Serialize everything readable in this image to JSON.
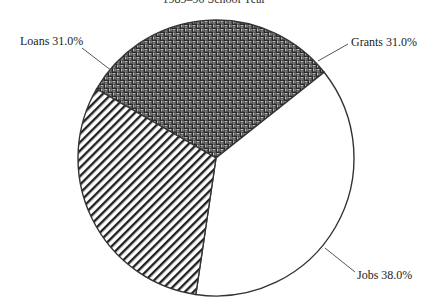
{
  "chart_data": {
    "type": "pie",
    "title": "1989–90 School Year",
    "title_partially_visible": true,
    "categories": [
      "Grants",
      "Jobs",
      "Loans"
    ],
    "values": [
      31.0,
      38.0,
      31.0
    ],
    "unit": "%",
    "labels": [
      "Grants 31.0%",
      "Jobs 38.0%",
      "Loans 31.0%"
    ],
    "slices": [
      {
        "name": "Grants",
        "value": 31.0,
        "label": "Grants 31.0%",
        "fill": "basketweave",
        "start_deg": 300,
        "end_deg": 411.6
      },
      {
        "name": "Jobs",
        "value": 38.0,
        "label": "Jobs 38.0%",
        "fill": "white",
        "start_deg": 411.6,
        "end_deg": 548.4
      },
      {
        "name": "Loans",
        "value": 31.0,
        "label": "Loans 31.0%",
        "fill": "diagonal-stripes",
        "start_deg": 548.4,
        "end_deg": 660
      }
    ],
    "legend": "none (direct labels with leader lines)",
    "grid": false
  },
  "colors": {
    "outline": "#333333",
    "stripe": "#222222",
    "weave_bg": "#2a2a2a",
    "weave_fg": "#c8c8c8",
    "background": "#ffffff"
  }
}
